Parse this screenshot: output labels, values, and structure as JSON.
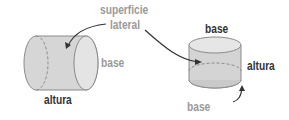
{
  "labels": {
    "lateral_surface_line1": "superficie",
    "lateral_surface_line2": "lateral",
    "left_base": "base",
    "left_height": "altura",
    "right_top_base": "base",
    "right_height": "altura",
    "right_bottom_base": "base"
  },
  "colors": {
    "cylinder_fill": "#d9d9d9",
    "cylinder_side": "#cfcfcf",
    "cylinder_cap": "#e6e6e6",
    "outline": "#8a8a8a",
    "dark_text": "#333333",
    "gray_text": "#9a9a9a",
    "arrow": "#333333"
  }
}
